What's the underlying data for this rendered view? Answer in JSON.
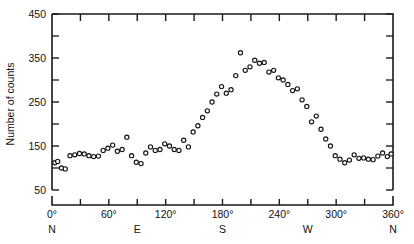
{
  "chart_data": {
    "type": "scatter",
    "title": "",
    "subtitle": "",
    "xlabel": "",
    "ylabel": "Number of counts",
    "xlim": [
      0,
      360
    ],
    "ylim": [
      50,
      450
    ],
    "grid": false,
    "legend": null,
    "x_major_ticks": [
      0,
      60,
      120,
      180,
      240,
      300,
      360
    ],
    "x_major_tick_labels": [
      "0°",
      "60°",
      "120°",
      "180°",
      "240°",
      "300°",
      "360°"
    ],
    "x_minor_ticks": [
      30,
      90,
      150,
      210,
      270,
      330
    ],
    "compass_ticks": [
      0,
      90,
      180,
      270,
      360
    ],
    "compass_labels": [
      "N",
      "E",
      "S",
      "W",
      "N"
    ],
    "y_major_ticks": [
      50,
      150,
      250,
      350,
      450
    ],
    "y_major_tick_labels": [
      "50",
      "150",
      "250",
      "350",
      "450"
    ],
    "y_minor_ticks": [
      100,
      200,
      300,
      400
    ],
    "marker": "open-circle",
    "marker_color": "#151515",
    "marker_fill": "#ffffff",
    "x": [
      3,
      6,
      10,
      14,
      19,
      24,
      29,
      34,
      39,
      44,
      49,
      54,
      59,
      64,
      69,
      74,
      79,
      84,
      89,
      94,
      99,
      104,
      109,
      114,
      119,
      124,
      129,
      134,
      139,
      144,
      149,
      154,
      159,
      164,
      169,
      174,
      179,
      184,
      189,
      194,
      199,
      204,
      209,
      214,
      219,
      224,
      229,
      234,
      239,
      244,
      249,
      254,
      259,
      264,
      269,
      274,
      279,
      284,
      289,
      294,
      299,
      304,
      309,
      314,
      319,
      324,
      329,
      334,
      339,
      344,
      349,
      354,
      358
    ],
    "y": [
      112,
      115,
      100,
      98,
      128,
      130,
      133,
      132,
      128,
      126,
      127,
      140,
      145,
      152,
      138,
      142,
      170,
      128,
      113,
      110,
      134,
      148,
      140,
      142,
      155,
      150,
      142,
      140,
      163,
      148,
      182,
      196,
      215,
      230,
      250,
      268,
      285,
      270,
      278,
      310,
      362,
      322,
      330,
      345,
      338,
      340,
      318,
      322,
      305,
      300,
      290,
      276,
      280,
      255,
      240,
      205,
      218,
      188,
      166,
      150,
      128,
      120,
      112,
      118,
      130,
      122,
      123,
      120,
      119,
      127,
      134,
      126,
      132
    ]
  },
  "figure": {
    "y_axis_title": "Number of counts"
  }
}
